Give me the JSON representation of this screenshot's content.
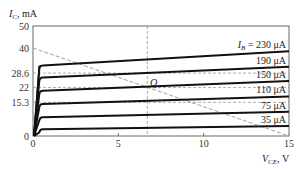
{
  "chart_data": {
    "type": "line",
    "title": "",
    "xlabel": "V_CE, V",
    "ylabel": "I_C, mA",
    "xlim": [
      0,
      15
    ],
    "ylim": [
      0,
      50
    ],
    "x_ticks": [
      0,
      5,
      10,
      15
    ],
    "y_ticks": [
      0,
      15.3,
      22,
      28.6,
      40,
      50
    ],
    "x_tick_labels": [
      "0",
      "5",
      "10",
      "15"
    ],
    "y_tick_labels": [
      "0",
      "15.3",
      "22",
      "28.6",
      "40",
      "50"
    ],
    "grid": false,
    "series": [
      {
        "name": "I_B = 230 μA",
        "label": "I_B = 230 μA",
        "x": [
          0,
          0.4,
          15
        ],
        "values": [
          0,
          32,
          38.5
        ]
      },
      {
        "name": "190 μA",
        "label": "190 μA",
        "x": [
          0,
          0.4,
          15
        ],
        "values": [
          0,
          26.5,
          31.5
        ]
      },
      {
        "name": "150 μA",
        "label": "150 μA",
        "x": [
          0,
          0.4,
          15
        ],
        "values": [
          0,
          20.5,
          25
        ]
      },
      {
        "name": "110 μA",
        "label": "110 μA",
        "x": [
          0,
          0.4,
          15
        ],
        "values": [
          0,
          14.5,
          18
        ]
      },
      {
        "name": "75 μA",
        "label": "75 μA",
        "x": [
          0,
          0.4,
          15
        ],
        "values": [
          0,
          8.5,
          11
        ]
      },
      {
        "name": "35 μA",
        "label": "35 μA",
        "x": [
          0,
          0.4,
          15
        ],
        "values": [
          0,
          3,
          4.5
        ]
      }
    ],
    "load_line": {
      "x": [
        0,
        15
      ],
      "values": [
        40,
        0
      ],
      "style": "dashed"
    },
    "q_point": {
      "label": "Q",
      "x": 6.7,
      "y": 22
    },
    "reference_lines": [
      {
        "axis": "y",
        "value": 28.6,
        "style": "dashed"
      },
      {
        "axis": "y",
        "value": 22,
        "style": "dashed"
      },
      {
        "axis": "y",
        "value": 15.3,
        "style": "dashed"
      },
      {
        "axis": "x",
        "value": 6.7,
        "style": "dashed"
      }
    ]
  },
  "labels": {
    "y_axis_symbol": "I",
    "y_axis_sub": "C",
    "y_axis_unit": ", mA",
    "x_axis_symbol": "V",
    "x_axis_sub": "CE",
    "x_axis_unit": ", V",
    "q_label": "Q",
    "ib_prefix_symbol": "I",
    "ib_prefix_sub": "B",
    "ib_prefix_eq": " = ",
    "curve_labels": [
      "230 μA",
      "190 μA",
      "150 μA",
      "110 μA",
      "75 μA",
      "35 μA"
    ]
  },
  "colors": {
    "curve": "#111111",
    "frame": "#444444",
    "dashed": "#888888"
  }
}
